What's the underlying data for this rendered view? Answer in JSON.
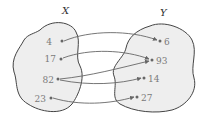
{
  "diagram": {
    "type": "mapping",
    "sets": {
      "X": {
        "label": "X",
        "elements": [
          "4",
          "17",
          "82",
          "23"
        ]
      },
      "Y": {
        "label": "Y",
        "elements": [
          "6",
          "93",
          "14",
          "27"
        ]
      }
    },
    "mappings": [
      {
        "from": "4",
        "to": "6"
      },
      {
        "from": "17",
        "to": "93"
      },
      {
        "from": "82",
        "to": "93"
      },
      {
        "from": "82",
        "to": "14"
      },
      {
        "from": "23",
        "to": "27"
      }
    ],
    "colors": {
      "blob_fill": "#eeeeee",
      "blob_stroke": "#444444",
      "arrow": "#666666",
      "text": "#7a7a7a"
    }
  }
}
